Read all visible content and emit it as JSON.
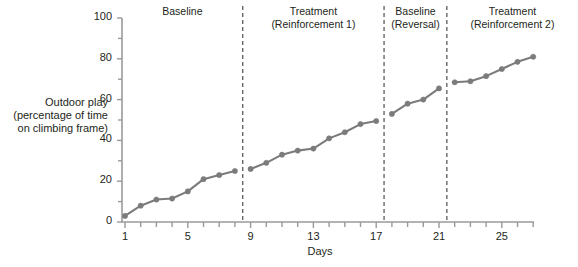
{
  "chart_data": {
    "type": "line",
    "title": "",
    "xlabel": "Days",
    "ylabel_lines": [
      "Outdoor play",
      "(percentage of time",
      "on climbing frame)"
    ],
    "ylabel": "Outdoor play (percentage of time on climbing frame)",
    "xlim": [
      0.4,
      27.6
    ],
    "ylim": [
      0,
      100
    ],
    "xticks": [
      1,
      5,
      9,
      13,
      17,
      21,
      25
    ],
    "xtick_labels": [
      "1",
      "5",
      "9",
      "13",
      "17",
      "21",
      "25"
    ],
    "yticks": [
      0,
      20,
      40,
      60,
      80,
      100
    ],
    "ytick_labels": [
      "0",
      "20",
      "40",
      "60",
      "80",
      "100"
    ],
    "minor_ytick_step": 10,
    "minor_xtick_step": 1,
    "grid": false,
    "legend": "none",
    "series_color": "#7b7b7b",
    "marker": "circle",
    "phases": [
      {
        "name": "baseline-1",
        "label_lines": [
          "Baseline"
        ],
        "x_start": 1,
        "x_end": 8,
        "x": [
          1,
          2,
          3,
          4,
          5,
          6,
          7,
          8
        ],
        "y": [
          3,
          8,
          11,
          11.5,
          15,
          21,
          23,
          25
        ]
      },
      {
        "name": "treatment-1",
        "label_lines": [
          "Treatment",
          "(Reinforcement 1)"
        ],
        "x_start": 9,
        "x_end": 17,
        "x": [
          9,
          10,
          11,
          12,
          13,
          14,
          15,
          16,
          17
        ],
        "y": [
          26,
          29,
          33,
          35,
          36,
          41,
          44,
          48,
          49.5
        ]
      },
      {
        "name": "baseline-reversal",
        "label_lines": [
          "Baseline",
          "(Reversal)"
        ],
        "x_start": 18,
        "x_end": 21,
        "x": [
          18,
          19,
          20,
          21
        ],
        "y": [
          53,
          58,
          60,
          65.5
        ]
      },
      {
        "name": "treatment-2",
        "label_lines": [
          "Treatment",
          "(Reinforcement 2)"
        ],
        "x_start": 22,
        "x_end": 27,
        "x": [
          22,
          23,
          24,
          25,
          26,
          27
        ],
        "y": [
          68.5,
          69,
          71.5,
          75,
          78.5,
          81
        ]
      }
    ],
    "phase_dividers": [
      8.5,
      17.5,
      21.5
    ],
    "all_points": [
      {
        "day": 1,
        "value": 3
      },
      {
        "day": 2,
        "value": 8
      },
      {
        "day": 3,
        "value": 11
      },
      {
        "day": 4,
        "value": 11.5
      },
      {
        "day": 5,
        "value": 15
      },
      {
        "day": 6,
        "value": 21
      },
      {
        "day": 7,
        "value": 23
      },
      {
        "day": 8,
        "value": 25
      },
      {
        "day": 9,
        "value": 26
      },
      {
        "day": 10,
        "value": 29
      },
      {
        "day": 11,
        "value": 33
      },
      {
        "day": 12,
        "value": 35
      },
      {
        "day": 13,
        "value": 36
      },
      {
        "day": 14,
        "value": 41
      },
      {
        "day": 15,
        "value": 44
      },
      {
        "day": 16,
        "value": 48
      },
      {
        "day": 17,
        "value": 49.5
      },
      {
        "day": 18,
        "value": 53
      },
      {
        "day": 19,
        "value": 58
      },
      {
        "day": 20,
        "value": 60
      },
      {
        "day": 21,
        "value": 65.5
      },
      {
        "day": 22,
        "value": 68.5
      },
      {
        "day": 23,
        "value": 69
      },
      {
        "day": 24,
        "value": 71.5
      },
      {
        "day": 25,
        "value": 75
      },
      {
        "day": 26,
        "value": 78.5
      },
      {
        "day": 27,
        "value": 81
      }
    ]
  },
  "colors": {
    "axis": "#9a9a9a",
    "series": "#7b7b7b",
    "divider": "#4d4d4d",
    "text": "#231f20",
    "background": "#ffffff"
  }
}
